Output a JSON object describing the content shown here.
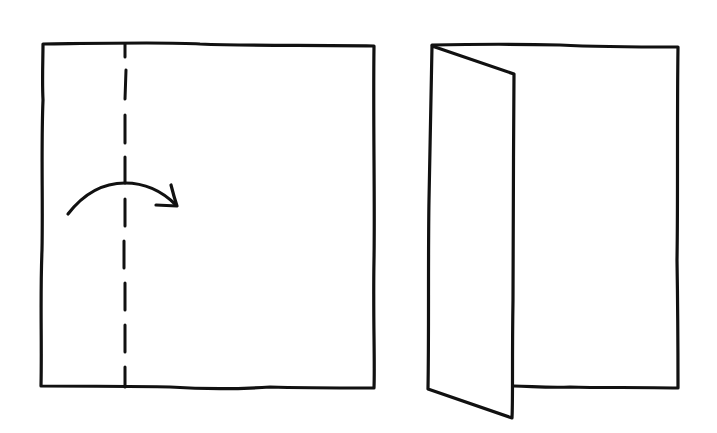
{
  "diagram": {
    "type": "paper-folding-instructions",
    "description": "Fold the left edge of a square sheet along the dashed line toward the right",
    "stroke_color": "#111111",
    "background_color": "#ffffff",
    "steps": [
      {
        "id": "step-1",
        "label": "Unfolded square with dashed vertical fold line near left edge and curved arrow pointing right",
        "elements": [
          "square-sheet",
          "dashed-fold-line",
          "fold-direction-arrow"
        ]
      },
      {
        "id": "step-2",
        "label": "Sheet with left flap folded over, shown in perspective",
        "elements": [
          "base-sheet",
          "folded-flap"
        ]
      }
    ]
  }
}
